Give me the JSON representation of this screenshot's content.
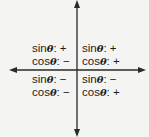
{
  "diagram": {
    "title": "",
    "axes": {
      "horizontal": "x-axis with arrows both ends",
      "vertical": "y-axis with arrows both ends"
    },
    "quadrants": [
      {
        "name": "II",
        "position": "top-left",
        "sin_label": "sin",
        "sin_sign": ": +",
        "cos_label": "cos",
        "cos_sign": ": −"
      },
      {
        "name": "I",
        "position": "top-right",
        "sin_label": "sin",
        "sin_sign": ": +",
        "cos_label": "cos",
        "cos_sign": ": +"
      },
      {
        "name": "III",
        "position": "bottom-left",
        "sin_label": "sin",
        "sin_sign": ": −",
        "cos_label": "cos",
        "cos_sign": ": −"
      },
      {
        "name": "IV",
        "position": "bottom-right",
        "sin_label": "sin",
        "sin_sign": ": −",
        "cos_label": "cos",
        "cos_sign": ": +"
      }
    ],
    "theta_symbol": "θ",
    "colors": {
      "axis": "#2a2a2a",
      "text": "#1e1e1e",
      "background": "#f4f4f2"
    }
  }
}
